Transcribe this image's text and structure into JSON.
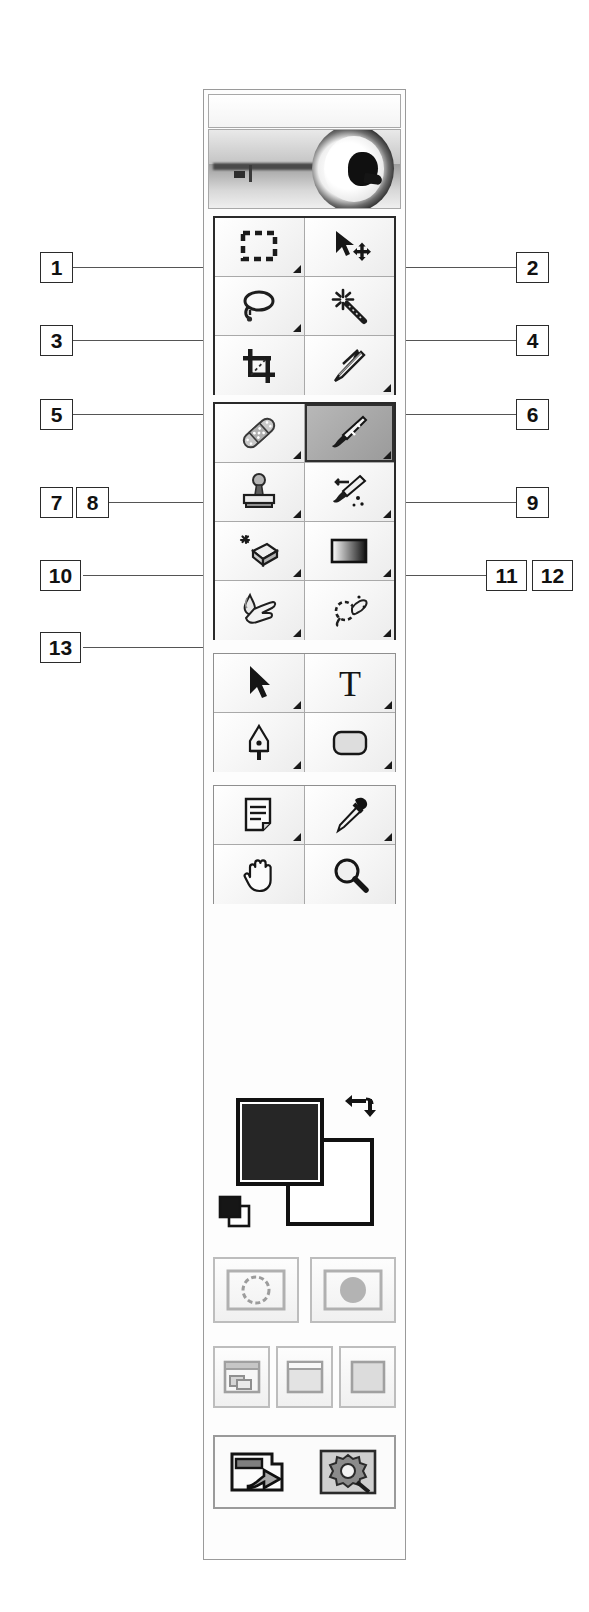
{
  "figure": {
    "kind": "photoshop-toolbox-diagram",
    "accent_dark": "#1a1a1a",
    "panel_border": "#8f8f8f",
    "selected_tool": "paintbrush-tool"
  },
  "palette": {
    "banner_alt": "grayscale photo of a key and an eye",
    "title_bar_label": ""
  },
  "tool_groups": [
    {
      "name": "selection-group",
      "emphasized": true,
      "tools": [
        {
          "name": "rectangular-marquee-tool",
          "icon": "marquee-icon",
          "has_flyout": true,
          "selected": false
        },
        {
          "name": "move-tool",
          "icon": "move-icon",
          "has_flyout": false,
          "selected": false
        },
        {
          "name": "lasso-tool",
          "icon": "lasso-icon",
          "has_flyout": true,
          "selected": false
        },
        {
          "name": "magic-wand-tool",
          "icon": "magic-wand-icon",
          "has_flyout": false,
          "selected": false
        },
        {
          "name": "crop-tool",
          "icon": "crop-icon",
          "has_flyout": false,
          "selected": false
        },
        {
          "name": "slice-tool",
          "icon": "slice-knife-icon",
          "has_flyout": true,
          "selected": false
        }
      ]
    },
    {
      "name": "retouch-paint-group",
      "emphasized": true,
      "tools": [
        {
          "name": "healing-brush-tool",
          "icon": "bandage-icon",
          "has_flyout": true,
          "selected": false
        },
        {
          "name": "paintbrush-tool",
          "icon": "paintbrush-icon",
          "has_flyout": true,
          "selected": true
        },
        {
          "name": "clone-stamp-tool",
          "icon": "rubber-stamp-icon",
          "has_flyout": true,
          "selected": false
        },
        {
          "name": "history-brush-tool",
          "icon": "history-brush-icon",
          "has_flyout": true,
          "selected": false
        },
        {
          "name": "eraser-tool",
          "icon": "eraser-icon",
          "has_flyout": true,
          "selected": false
        },
        {
          "name": "gradient-tool",
          "icon": "gradient-icon",
          "has_flyout": true,
          "selected": false
        },
        {
          "name": "blur-tool",
          "icon": "waterdrop-hand-icon",
          "has_flyout": true,
          "selected": false
        },
        {
          "name": "dodge-tool",
          "icon": "dodge-burn-icon",
          "has_flyout": true,
          "selected": false
        }
      ]
    },
    {
      "name": "vector-type-group",
      "emphasized": false,
      "tools": [
        {
          "name": "path-selection-tool",
          "icon": "arrow-pointer-icon",
          "has_flyout": true,
          "selected": false
        },
        {
          "name": "type-tool",
          "icon": "text-t-icon",
          "has_flyout": true,
          "selected": false
        },
        {
          "name": "pen-tool",
          "icon": "pen-nib-icon",
          "has_flyout": true,
          "selected": false
        },
        {
          "name": "shape-tool",
          "icon": "rounded-rectangle-icon",
          "has_flyout": true,
          "selected": false
        }
      ]
    },
    {
      "name": "annotation-navigation-group",
      "emphasized": false,
      "tools": [
        {
          "name": "notes-tool",
          "icon": "note-page-icon",
          "has_flyout": true,
          "selected": false
        },
        {
          "name": "eyedropper-tool",
          "icon": "eyedropper-icon",
          "has_flyout": true,
          "selected": false
        },
        {
          "name": "hand-tool",
          "icon": "hand-icon",
          "has_flyout": false,
          "selected": false
        },
        {
          "name": "zoom-tool",
          "icon": "magnifier-icon",
          "has_flyout": false,
          "selected": false
        }
      ]
    }
  ],
  "colors": {
    "foreground_swatch": "#262626",
    "background_swatch": "#ffffff",
    "swap_icon": "swap-colors-arrow-icon",
    "defaults_icon": "default-colors-icon"
  },
  "mask_modes": [
    {
      "name": "standard-mode-button",
      "icon": "standard-mode-icon",
      "selected": true
    },
    {
      "name": "quick-mask-mode-button",
      "icon": "quick-mask-mode-icon",
      "selected": false
    }
  ],
  "screen_modes": [
    {
      "name": "standard-screen-mode-button",
      "icon": "standard-screen-icon"
    },
    {
      "name": "full-screen-with-menubar-mode-button",
      "icon": "full-screen-menubar-icon"
    },
    {
      "name": "full-screen-mode-button",
      "icon": "full-screen-icon"
    }
  ],
  "jump_to": {
    "name": "jump-to-imageready-button",
    "icons": [
      "jump-to-arrow-icon",
      "imageready-app-icon"
    ]
  },
  "callouts": {
    "left": [
      {
        "label": "1",
        "top": 252,
        "pairs": false
      },
      {
        "label": "3",
        "top": 325,
        "pairs": false
      },
      {
        "label": "5",
        "top": 399,
        "pairs": false
      },
      {
        "label": "7",
        "top": 487,
        "pairs": true,
        "label2": "8"
      },
      {
        "label": "10",
        "top": 560,
        "pairs": false
      },
      {
        "label": "13",
        "top": 632,
        "pairs": false
      }
    ],
    "right": [
      {
        "label": "2",
        "top": 252,
        "pairs": false
      },
      {
        "label": "4",
        "top": 325,
        "pairs": false
      },
      {
        "label": "6",
        "top": 399,
        "pairs": false
      },
      {
        "label": "9",
        "top": 487,
        "pairs": false
      },
      {
        "label": "11",
        "top": 560,
        "pairs": true,
        "label2": "12"
      }
    ]
  }
}
